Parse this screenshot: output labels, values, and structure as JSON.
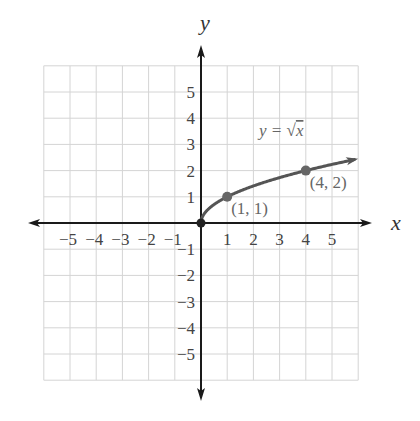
{
  "chart_data": {
    "type": "line",
    "title": "",
    "function_label": "y = √x",
    "xlabel": "x",
    "ylabel": "y",
    "xlim": [
      -6,
      6
    ],
    "ylim": [
      -6,
      6
    ],
    "grid": true,
    "x_tick_labels": [
      "−5",
      "−4",
      "−3",
      "−2",
      "−1",
      "1",
      "2",
      "3",
      "4",
      "5"
    ],
    "x_ticks": [
      -5,
      -4,
      -3,
      -2,
      -1,
      1,
      2,
      3,
      4,
      5
    ],
    "y_tick_labels": [
      "5",
      "4",
      "3",
      "2",
      "1",
      "−1",
      "−2",
      "−3",
      "−4",
      "−5"
    ],
    "y_ticks": [
      5,
      4,
      3,
      2,
      1,
      -1,
      -2,
      -3,
      -4,
      -5
    ],
    "series": [
      {
        "name": "y = √x",
        "x": [
          0,
          0.25,
          0.5,
          1,
          2,
          3,
          4,
          5,
          6
        ],
        "y": [
          0,
          0.5,
          0.707,
          1,
          1.414,
          1.732,
          2,
          2.236,
          2.449
        ],
        "color": "#555555"
      }
    ],
    "labeled_points": [
      {
        "x": 0,
        "y": 0,
        "label": ""
      },
      {
        "x": 1,
        "y": 1,
        "label": "(1, 1)"
      },
      {
        "x": 4,
        "y": 2,
        "label": "(4, 2)"
      }
    ],
    "colors": {
      "axis": "#1a1a1a",
      "grid": "#d4d4d4",
      "curve": "#555555",
      "label": "#666666"
    }
  }
}
